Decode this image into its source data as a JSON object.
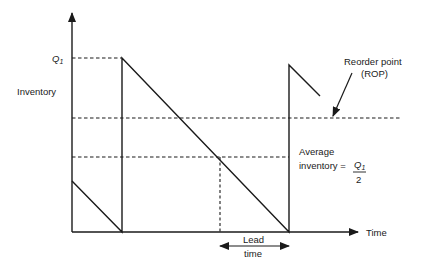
{
  "diagram": {
    "type": "inventory-sawtooth",
    "labels": {
      "y_axis": "Inventory",
      "x_axis": "Time",
      "q_level": "Q",
      "q_sub": "1",
      "rop_line1": "Reorder point",
      "rop_line2": "(ROP)",
      "avg_line1": "Average",
      "avg_line2": "inventory =",
      "avg_num": "Q",
      "avg_num_sub": "1",
      "avg_den": "2",
      "lead_line1": "Lead",
      "lead_line2": "time"
    },
    "colors": {
      "line": "#1a1a1a",
      "background": "#ffffff"
    }
  }
}
